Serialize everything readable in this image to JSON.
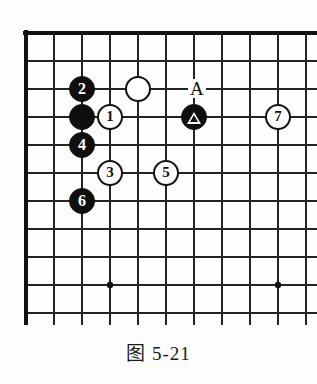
{
  "figure": {
    "caption": "图 5-21",
    "kind": "go-board-diagram",
    "board": {
      "cols": 11,
      "rows": 10,
      "cell_size": 28,
      "origin_x": 26,
      "origin_y": 33,
      "line_color": "#262320",
      "edge_color": "#141210",
      "background_color": "#fdfdfb",
      "edges": {
        "top": true,
        "left": true,
        "right": false,
        "bottom": false
      },
      "star_points": [
        {
          "col": 3,
          "row": 9
        },
        {
          "col": 9,
          "row": 9
        }
      ]
    },
    "stones": [
      {
        "id": "stone-white-1",
        "color": "white",
        "label": "1",
        "col": 3,
        "row": 3
      },
      {
        "id": "stone-black-2",
        "color": "black",
        "label": "2",
        "col": 2,
        "row": 2
      },
      {
        "id": "stone-white-3",
        "color": "white",
        "label": "3",
        "col": 3,
        "row": 5
      },
      {
        "id": "stone-black-4",
        "color": "black",
        "label": "4",
        "col": 2,
        "row": 4
      },
      {
        "id": "stone-white-5",
        "color": "white",
        "label": "5",
        "col": 5,
        "row": 5
      },
      {
        "id": "stone-black-6",
        "color": "black",
        "label": "6",
        "col": 2,
        "row": 6
      },
      {
        "id": "stone-white-7",
        "color": "white",
        "label": "7",
        "col": 9,
        "row": 3
      },
      {
        "id": "stone-black-plain",
        "color": "black",
        "label": "",
        "col": 2,
        "row": 3
      },
      {
        "id": "stone-white-plain",
        "color": "white",
        "label": "",
        "col": 4,
        "row": 2
      },
      {
        "id": "stone-black-triangle",
        "color": "black",
        "label": "",
        "marker": "triangle",
        "col": 6,
        "row": 3
      }
    ],
    "labels": [
      {
        "id": "point-label-a",
        "text": "A",
        "col": 6,
        "row": 2
      }
    ]
  }
}
